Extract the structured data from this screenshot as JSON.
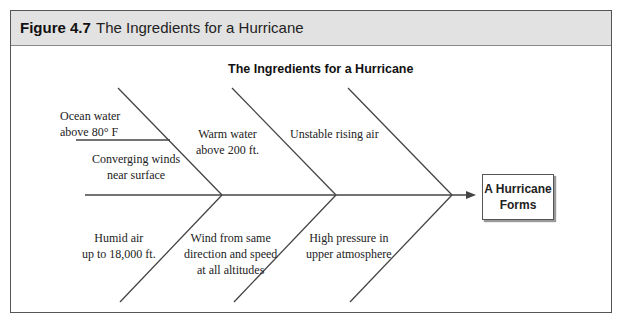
{
  "figure": {
    "number": "Figure 4.7",
    "title": "The Ingredients for a Hurricane"
  },
  "diagram": {
    "type": "fishbone",
    "title": "The Ingredients for a Hurricane",
    "result": {
      "line1": "A Hurricane",
      "line2": "Forms"
    },
    "upper_causes": [
      {
        "line1": "Ocean water",
        "line2": "above 80° F"
      },
      {
        "line1": "Converging winds",
        "line2": "near surface"
      },
      {
        "line1": "Warm water",
        "line2": "above 200 ft."
      },
      {
        "line1": "Unstable rising air",
        "line2": ""
      }
    ],
    "lower_causes": [
      {
        "line1": "Humid air",
        "line2": "up to 18,000 ft."
      },
      {
        "line1": "Wind from same",
        "line2": "direction and speed",
        "line3": "at all altitudes"
      },
      {
        "line1": "High pressure in",
        "line2": "upper atmosphere"
      }
    ],
    "colors": {
      "line": "#444444",
      "header_bg": "#e2e2e2"
    }
  }
}
